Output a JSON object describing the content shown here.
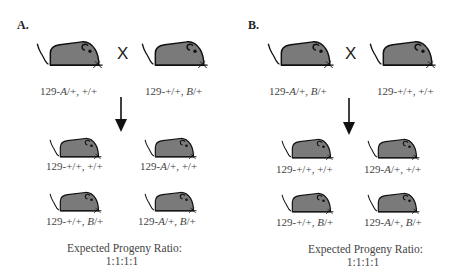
{
  "colors": {
    "mouse_fill": "#7a7a7a",
    "outline": "#111111",
    "text": "#444444"
  },
  "panels": [
    {
      "label": "A.",
      "cross_symbol": "X",
      "parents": [
        {
          "prefix": "129-",
          "allele1": "A",
          "rest1": "/+, ",
          "allele2": "",
          "rest2": "+/+",
          "text": "129-A/+, +/+"
        },
        {
          "prefix": "129-",
          "allele1": "",
          "rest1": "+/+, ",
          "allele2": "B",
          "rest2": "/+",
          "text": "129-+/+, B/+"
        }
      ],
      "progeny": [
        {
          "text": "129-+/+, +/+",
          "prefix": "129-",
          "allele1": "",
          "rest1": "+/+, ",
          "allele2": "",
          "rest2": "+/+"
        },
        {
          "text": "129-A/+, +/+",
          "prefix": "129-",
          "allele1": "A",
          "rest1": "/+, ",
          "allele2": "",
          "rest2": "+/+"
        },
        {
          "text": "129-+/+, B/+",
          "prefix": "129-",
          "allele1": "",
          "rest1": "+/+, ",
          "allele2": "B",
          "rest2": "/+"
        },
        {
          "text": "129-A/+, B/+",
          "prefix": "129-",
          "allele1": "A",
          "rest1": "/+, ",
          "allele2": "B",
          "rest2": "/+"
        }
      ],
      "ratio_title": "Expected Progeny Ratio:",
      "ratio_value": "1:1:1:1"
    },
    {
      "label": "B.",
      "cross_symbol": "X",
      "parents": [
        {
          "prefix": "129-",
          "allele1": "A",
          "rest1": "/+, ",
          "allele2": "B",
          "rest2": "/+",
          "text": "129-A/+, B/+"
        },
        {
          "prefix": "129-",
          "allele1": "",
          "rest1": "+/+, ",
          "allele2": "",
          "rest2": "+/+",
          "text": "129-+/+, +/+"
        }
      ],
      "progeny": [
        {
          "text": "129-+/+, +/+",
          "prefix": "129-",
          "allele1": "",
          "rest1": "+/+, ",
          "allele2": "",
          "rest2": "+/+"
        },
        {
          "text": "129-A/+, +/+",
          "prefix": "129-",
          "allele1": "A",
          "rest1": "/+, ",
          "allele2": "",
          "rest2": "+/+"
        },
        {
          "text": "129-+/+, B/+",
          "prefix": "129-",
          "allele1": "",
          "rest1": "+/+, ",
          "allele2": "B",
          "rest2": "/+"
        },
        {
          "text": "129-A/+, B/+",
          "prefix": "129-",
          "allele1": "A",
          "rest1": "/+, ",
          "allele2": "B",
          "rest2": "/+"
        }
      ],
      "ratio_title": "Expected Progeny Ratio:",
      "ratio_value": "1:1:1:1"
    }
  ]
}
